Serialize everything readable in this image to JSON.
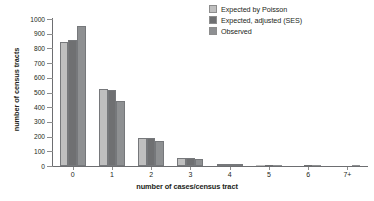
{
  "chart_data": {
    "type": "bar",
    "title": "",
    "subtitle": "",
    "xlabel": "number of cases/census tract",
    "ylabel": "number of census tracts",
    "categories": [
      "0",
      "1",
      "2",
      "3",
      "4",
      "5",
      "6",
      "7+"
    ],
    "ylim": [
      0,
      1000
    ],
    "yticks": [
      0,
      100,
      200,
      300,
      400,
      500,
      600,
      700,
      800,
      900,
      1000
    ],
    "ytick_labels": [
      "0",
      "100",
      "200",
      "300",
      "400",
      "500",
      "600",
      "700",
      "800",
      "900",
      "1000"
    ],
    "grid": false,
    "legend_position": "top-right",
    "series": [
      {
        "name": "Expected by Poisson",
        "color": "#bfbfbf",
        "values": [
          845,
          525,
          193,
          55,
          12,
          2,
          0,
          0
        ]
      },
      {
        "name": "Expected, adjusted (SES)",
        "color": "#6f7072",
        "values": [
          855,
          520,
          192,
          55,
          15,
          3,
          1,
          0
        ]
      },
      {
        "name": "Observed",
        "color": "#8e9092",
        "values": [
          950,
          445,
          168,
          45,
          14,
          8,
          2,
          4
        ]
      }
    ]
  },
  "axes": {
    "x_title": "number of cases/census tract",
    "y_title": "number of census tracts"
  },
  "legend": {
    "entries": [
      {
        "label": "Expected by Poisson",
        "color": "#bfbfbf"
      },
      {
        "label": "Expected, adjusted (SES)",
        "color": "#6f7072"
      },
      {
        "label": "Observed",
        "color": "#8e9092"
      }
    ]
  },
  "colors": {
    "axis": "#6d6e71",
    "text": "#231f20",
    "background": "#ffffff",
    "bar_outline": "#76787b"
  }
}
